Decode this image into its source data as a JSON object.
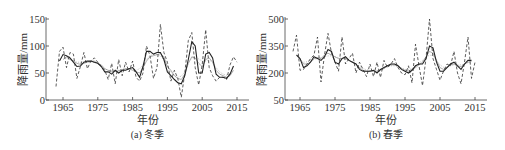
{
  "chart_data": [
    {
      "type": "line",
      "title": "",
      "caption": "(a) 冬季",
      "xlabel": "年份",
      "ylabel": "降雨量/mm",
      "xlim": [
        1961,
        2018
      ],
      "ylim": [
        0,
        150
      ],
      "xticks": [
        1965,
        1975,
        1985,
        1995,
        2005,
        2015
      ],
      "yticks": [
        0,
        50,
        100,
        150
      ],
      "grid": false,
      "legend": null,
      "x": [
        1963,
        1964,
        1965,
        1966,
        1967,
        1968,
        1969,
        1970,
        1971,
        1972,
        1973,
        1974,
        1975,
        1976,
        1977,
        1978,
        1979,
        1980,
        1981,
        1982,
        1983,
        1984,
        1985,
        1986,
        1987,
        1988,
        1989,
        1990,
        1991,
        1992,
        1993,
        1994,
        1995,
        1996,
        1997,
        1998,
        1999,
        2000,
        2001,
        2002,
        2003,
        2004,
        2005,
        2006,
        2007,
        2008,
        2009,
        2010,
        2011,
        2012,
        2013,
        2014,
        2015,
        2016
      ],
      "series": [
        {
          "name": "annual",
          "style": "dashed",
          "color": "#333333",
          "values": [
            25,
            90,
            98,
            60,
            88,
            85,
            40,
            62,
            88,
            58,
            72,
            78,
            70,
            62,
            55,
            38,
            68,
            30,
            75,
            45,
            70,
            52,
            72,
            42,
            35,
            50,
            100,
            82,
            40,
            60,
            140,
            88,
            70,
            35,
            55,
            40,
            5,
            50,
            110,
            125,
            60,
            28,
            65,
            130,
            60,
            45,
            35,
            42,
            42,
            38,
            65,
            80,
            70,
            null
          ]
        },
        {
          "name": "3-yr moving average",
          "style": "solid",
          "color": "#222222",
          "values": [
            null,
            72,
            84,
            82,
            78,
            70,
            62,
            63,
            70,
            72,
            72,
            70,
            68,
            62,
            52,
            52,
            48,
            55,
            50,
            55,
            55,
            58,
            60,
            52,
            42,
            62,
            90,
            90,
            85,
            88,
            88,
            75,
            52,
            45,
            38,
            32,
            30,
            45,
            75,
            108,
            100,
            50,
            50,
            85,
            88,
            78,
            48,
            42,
            42,
            40,
            48,
            63,
            null,
            null
          ]
        },
        {
          "name": "5-yr moving average",
          "style": "solid",
          "color": "#999999",
          "values": [
            null,
            null,
            75,
            80,
            75,
            72,
            68,
            66,
            68,
            70,
            72,
            72,
            68,
            65,
            58,
            55,
            52,
            53,
            54,
            56,
            58,
            58,
            55,
            52,
            50,
            60,
            72,
            80,
            82,
            84,
            86,
            80,
            62,
            55,
            45,
            40,
            38,
            48,
            68,
            80,
            78,
            68,
            62,
            75,
            78,
            70,
            55,
            48,
            45,
            42,
            45,
            55,
            null,
            null
          ]
        },
        {
          "name": "trend",
          "style": "dotted",
          "color": "#aaaaaa",
          "values": [
            null,
            null,
            null,
            78,
            76,
            73,
            70,
            70,
            70,
            71,
            71,
            70,
            67,
            62,
            58,
            55,
            54,
            54,
            55,
            57,
            58,
            58,
            56,
            55,
            58,
            65,
            75,
            82,
            84,
            84,
            82,
            74,
            62,
            52,
            45,
            42,
            44,
            52,
            68,
            78,
            80,
            76,
            72,
            72,
            74,
            70,
            60,
            52,
            48,
            46,
            48,
            55,
            null,
            null
          ]
        }
      ]
    },
    {
      "type": "line",
      "title": "",
      "caption": "(b) 春季",
      "xlabel": "年份",
      "ylabel": "降雨量/mm",
      "xlim": [
        1961,
        2018
      ],
      "ylim": [
        50,
        500
      ],
      "xticks": [
        1965,
        1975,
        1985,
        1995,
        2005,
        2015
      ],
      "yticks": [
        50,
        200,
        350,
        500
      ],
      "grid": false,
      "legend": null,
      "x": [
        1963,
        1964,
        1965,
        1966,
        1967,
        1968,
        1969,
        1970,
        1971,
        1972,
        1973,
        1974,
        1975,
        1976,
        1977,
        1978,
        1979,
        1980,
        1981,
        1982,
        1983,
        1984,
        1985,
        1986,
        1987,
        1988,
        1989,
        1990,
        1991,
        1992,
        1993,
        1994,
        1995,
        1996,
        1997,
        1998,
        1999,
        2000,
        2001,
        2002,
        2003,
        2004,
        2005,
        2006,
        2007,
        2008,
        2009,
        2010,
        2011,
        2012,
        2013,
        2014,
        2015,
        2016
      ],
      "series": [
        {
          "name": "annual",
          "style": "dashed",
          "color": "#333333",
          "values": [
            320,
            410,
            215,
            220,
            250,
            280,
            300,
            400,
            150,
            300,
            420,
            310,
            260,
            210,
            400,
            250,
            280,
            310,
            200,
            260,
            220,
            180,
            250,
            180,
            260,
            175,
            270,
            230,
            250,
            280,
            230,
            200,
            190,
            240,
            145,
            360,
            240,
            130,
            280,
            500,
            280,
            220,
            160,
            210,
            250,
            240,
            320,
            200,
            140,
            260,
            400,
            170,
            260,
            null
          ]
        },
        {
          "name": "3-yr moving average",
          "style": "solid",
          "color": "#222222",
          "values": [
            null,
            300,
            280,
            230,
            240,
            260,
            290,
            280,
            270,
            290,
            330,
            320,
            260,
            250,
            280,
            290,
            270,
            260,
            250,
            220,
            210,
            210,
            210,
            215,
            200,
            220,
            230,
            240,
            250,
            250,
            240,
            220,
            210,
            200,
            215,
            240,
            250,
            250,
            280,
            350,
            340,
            260,
            210,
            210,
            230,
            250,
            260,
            240,
            220,
            250,
            270,
            270,
            null,
            null
          ]
        },
        {
          "name": "5-yr moving average",
          "style": "solid",
          "color": "#999999",
          "values": [
            null,
            null,
            280,
            250,
            250,
            260,
            280,
            285,
            280,
            300,
            310,
            300,
            290,
            280,
            280,
            280,
            270,
            260,
            250,
            230,
            215,
            210,
            210,
            210,
            210,
            215,
            225,
            240,
            245,
            245,
            240,
            225,
            215,
            210,
            220,
            230,
            245,
            260,
            290,
            320,
            310,
            270,
            230,
            220,
            230,
            245,
            250,
            240,
            235,
            250,
            260,
            265,
            null,
            null
          ]
        },
        {
          "name": "trend",
          "style": "dotted",
          "color": "#aaaaaa",
          "values": [
            null,
            null,
            null,
            260,
            262,
            270,
            275,
            280,
            285,
            290,
            295,
            295,
            290,
            285,
            282,
            278,
            270,
            262,
            250,
            238,
            225,
            218,
            214,
            212,
            212,
            216,
            225,
            235,
            240,
            240,
            236,
            228,
            220,
            218,
            225,
            238,
            255,
            270,
            285,
            300,
            295,
            270,
            245,
            232,
            232,
            240,
            245,
            245,
            245,
            250,
            258,
            262,
            null,
            null
          ]
        }
      ]
    }
  ],
  "panels": [
    {
      "caption": "(a) 冬季",
      "xlabel": "年份",
      "ylabel": "降雨量/mm"
    },
    {
      "caption": "(b) 春季",
      "xlabel": "年份",
      "ylabel": "降雨量/mm"
    }
  ]
}
